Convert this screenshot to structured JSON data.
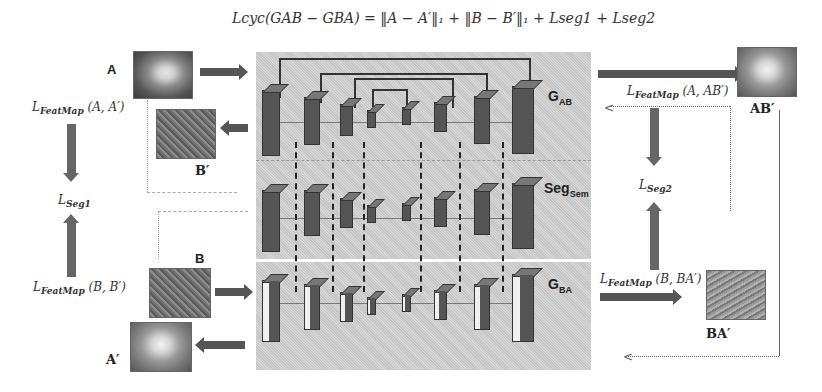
{
  "formula": "L_cyc(G_AB − G_BA) = ‖A − A′‖₁ + ‖B − B′‖₁ + L_seg1 + L_seg2",
  "formula_display": "𝐿cyc(GAB − GBA) = ‖A − A′‖₁ + ‖B − B′‖₁ + Lseg1 + Lseg2",
  "images": {
    "A": "A",
    "B_prime": "B′",
    "B": "B",
    "A_prime": "A′",
    "AB_prime": "AB′",
    "BA_prime": "BA′"
  },
  "generators": {
    "G_AB": {
      "main": "G",
      "sub": "AB"
    },
    "Seg_Sem": {
      "main": "Seg",
      "sub": "Sem"
    },
    "G_BA": {
      "main": "G",
      "sub": "BA"
    }
  },
  "losses": {
    "featmap_A_A": {
      "main": "L",
      "sub": "FeatMap",
      "args": " (A, A′)"
    },
    "featmap_B_B": {
      "main": "L",
      "sub": "FeatMap",
      "args": " (B, B′)"
    },
    "seg1": {
      "main": "L",
      "sub": "Seg1"
    },
    "featmap_A_AB": {
      "main": "L",
      "sub": "FeatMap",
      "args": " (A, AB′)"
    },
    "featmap_B_BA": {
      "main": "L",
      "sub": "FeatMap",
      "args": " (B, BA′)"
    },
    "seg2": {
      "main": "L",
      "sub": "Seg2"
    }
  },
  "colors": {
    "panel": "#cccccc",
    "block": "#555555",
    "arrow": "#555555",
    "line": "#777777"
  }
}
